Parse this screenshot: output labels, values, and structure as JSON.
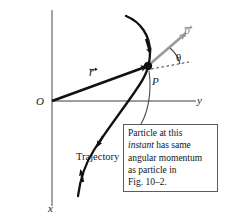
{
  "figure": {
    "kind": "physics-vector-diagram",
    "axes": {
      "y_axis_label": "y",
      "x_axis_label": "x",
      "origin_label": "O",
      "axis_color": "#7d7d7d",
      "origin_px": {
        "x": 52,
        "y": 101
      }
    },
    "point": {
      "label": "P",
      "marker_color": "#111111",
      "px": {
        "x": 148,
        "y": 66
      }
    },
    "vectors": [
      {
        "name": "position-vector",
        "label": "r",
        "has_overarrow": true,
        "color": "#111111",
        "from_px": {
          "x": 52,
          "y": 101
        },
        "to_px": {
          "x": 148,
          "y": 66
        }
      },
      {
        "name": "momentum-vector",
        "label": "p",
        "has_overarrow": true,
        "color": "#9a9a9a",
        "from_px": {
          "x": 150,
          "y": 64
        },
        "to_px": {
          "x": 186,
          "y": 33
        }
      }
    ],
    "angle": {
      "label": "θ",
      "between": "dashed-reference-line and momentum-vector",
      "color": "#555555"
    },
    "curve": {
      "name": "trajectory",
      "label": "Trajectory",
      "color": "#111111",
      "direction_arrows": 3
    },
    "callout": {
      "border_color": "#5a5a66",
      "lines": [
        {
          "text": "Particle at this",
          "italic": false
        },
        {
          "text": "instant",
          "italic": true,
          "suffix": " has same"
        },
        {
          "text": "angular momentum",
          "italic": false
        },
        {
          "text": "as particle in",
          "italic": false
        },
        {
          "text": "Fig. 10–2.",
          "italic": false
        }
      ],
      "line1": "Particle at this",
      "line2_italic": "instant",
      "line2_rest": " has same",
      "line3": "angular momentum",
      "line4": "as particle in",
      "line5": "Fig. 10–2."
    }
  }
}
